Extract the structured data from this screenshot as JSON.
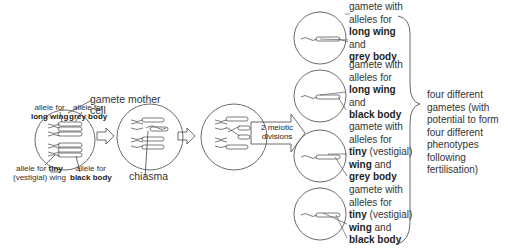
{
  "diagram": {
    "mother_cell": {
      "label_line1": "gamete mother",
      "label_line2": "cell",
      "allele_long_wing": {
        "line1": "allele for",
        "line2": "long wing"
      },
      "allele_grey_body": {
        "line1": "allele for",
        "line2": "grey body"
      },
      "allele_tiny_wing": {
        "line1_prefix": "allele for ",
        "line1_bold": "tiny",
        "line2": "(vestigial) wing"
      },
      "allele_black_body": {
        "line1": "allele for",
        "line2": "black body"
      }
    },
    "chiasma_label": "chiasma",
    "division_arrow": {
      "line1": "2 meiotic",
      "line2": "divisions"
    },
    "gametes": [
      {
        "line1": "gamete with",
        "line2": "alleles for",
        "wing_bold": "long wing",
        "wing_suffix": "",
        "and_text": "and",
        "body_bold": "grey body"
      },
      {
        "line1": "gamete with",
        "line2": "alleles for",
        "wing_bold": "long wing",
        "wing_suffix": "",
        "and_text": "and",
        "body_bold": "black body"
      },
      {
        "line1": "gamete with",
        "line2": "alleles for",
        "wing_bold": "tiny",
        "wing_suffix": " (vestigial)",
        "wing2_bold": "wing",
        "and_text": " and",
        "body_bold": "grey body"
      },
      {
        "line1": "gamete with",
        "line2": "alleles for",
        "wing_bold": "tiny",
        "wing_suffix": " (vestigial)",
        "wing2_bold": "wing",
        "and_text": " and",
        "body_bold": "black body"
      }
    ],
    "summary": "four different\ngametes (with\npotential to form\nfour different\nphenotypes\nfollowing\nfertilisation)",
    "colors": {
      "line": "#555555",
      "text": "#333333",
      "background": "#ffffff"
    }
  }
}
